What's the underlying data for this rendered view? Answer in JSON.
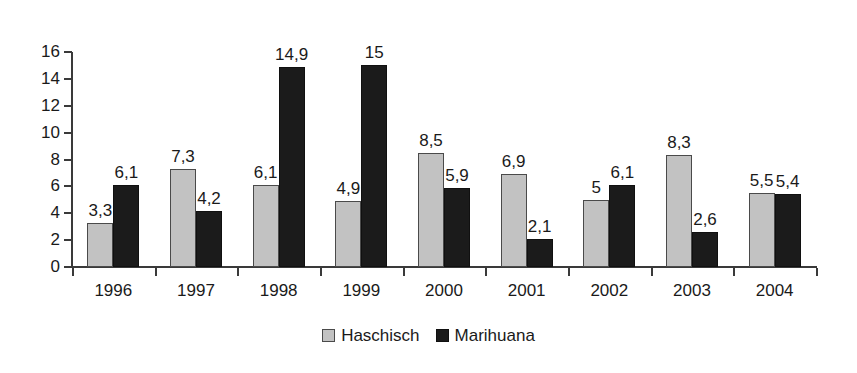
{
  "chart_data": {
    "type": "bar",
    "title": "",
    "subtitle": "",
    "xlabel": "",
    "ylabel": "",
    "categories": [
      "1996",
      "1997",
      "1998",
      "1999",
      "2000",
      "2001",
      "2002",
      "2003",
      "2004"
    ],
    "series": [
      {
        "name": "Haschisch",
        "color": "#c2c2c2",
        "values": [
          3.3,
          7.3,
          6.1,
          4.9,
          8.5,
          6.9,
          5,
          8.3,
          5.5
        ],
        "labels": [
          "3,3",
          "7,3",
          "6,1",
          "4,9",
          "8,5",
          "6,9",
          "5",
          "8,3",
          "5,5"
        ]
      },
      {
        "name": "Marihuana",
        "color": "#1b1b1b",
        "values": [
          6.1,
          4.2,
          14.9,
          15,
          5.9,
          2.1,
          6.1,
          2.6,
          5.4
        ],
        "labels": [
          "6,1",
          "4,2",
          "14,9",
          "15",
          "5,9",
          "2,1",
          "6,1",
          "2,6",
          "5,4"
        ]
      }
    ],
    "ylim": [
      0,
      16
    ],
    "yticks": [
      0,
      2,
      4,
      6,
      8,
      10,
      12,
      14,
      16
    ],
    "ytick_labels": [
      "0",
      "2",
      "4",
      "6",
      "8",
      "10",
      "12",
      "14",
      "16"
    ],
    "grid": false,
    "legend_position": "bottom",
    "legend_entries": [
      "Haschisch",
      "Marihuana"
    ]
  }
}
